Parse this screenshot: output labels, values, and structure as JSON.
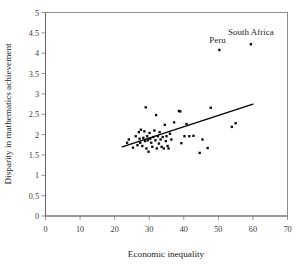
{
  "figure": {
    "background_color": "#ffffff",
    "frame_color": "#8d8d8d",
    "marker_color": "#111111",
    "line_color": "#000000"
  },
  "chart_data": {
    "type": "scatter",
    "title": "",
    "xlabel": "Economic inequality",
    "ylabel": "Disparity in mathematics achievement",
    "xlim": [
      0,
      70
    ],
    "ylim": [
      0,
      5
    ],
    "xticks": [
      0,
      10,
      20,
      30,
      40,
      50,
      60,
      70
    ],
    "yticks": [
      0,
      0.5,
      1,
      1.5,
      2,
      2.5,
      3,
      3.5,
      4,
      4.5,
      5
    ],
    "xtick_labels": [
      "0",
      "10",
      "20",
      "30",
      "40",
      "50",
      "60",
      "70"
    ],
    "ytick_labels": [
      "0",
      "0.5",
      "1",
      "1.5",
      "2",
      "2.5",
      "3",
      "3.5",
      "4",
      "4.5",
      "5"
    ],
    "grid": false,
    "legend": false,
    "marker": "square",
    "marker_size": 2.4,
    "points": [
      [
        23.6,
        1.8
      ],
      [
        24.1,
        1.88
      ],
      [
        25.3,
        1.68
      ],
      [
        26.1,
        1.96
      ],
      [
        26.6,
        1.74
      ],
      [
        27.0,
        2.06
      ],
      [
        27.2,
        1.9
      ],
      [
        27.4,
        1.8
      ],
      [
        27.6,
        2.12
      ],
      [
        28.0,
        1.72
      ],
      [
        28.3,
        1.92
      ],
      [
        28.6,
        2.08
      ],
      [
        28.8,
        1.84
      ],
      [
        29.0,
        2.67
      ],
      [
        29.2,
        1.66
      ],
      [
        29.4,
        1.96
      ],
      [
        29.6,
        1.86
      ],
      [
        29.8,
        1.58
      ],
      [
        30.1,
        2.04
      ],
      [
        30.3,
        1.9
      ],
      [
        30.6,
        1.8
      ],
      [
        30.9,
        1.7
      ],
      [
        31.2,
        1.94
      ],
      [
        31.5,
        2.1
      ],
      [
        31.8,
        1.86
      ],
      [
        32.0,
        2.48
      ],
      [
        32.2,
        1.66
      ],
      [
        32.5,
        1.96
      ],
      [
        32.8,
        1.78
      ],
      [
        33.0,
        2.06
      ],
      [
        33.3,
        1.88
      ],
      [
        33.6,
        1.7
      ],
      [
        33.9,
        1.94
      ],
      [
        34.2,
        1.66
      ],
      [
        34.5,
        2.24
      ],
      [
        34.8,
        1.84
      ],
      [
        35.0,
        1.96
      ],
      [
        35.3,
        1.72
      ],
      [
        35.6,
        1.66
      ],
      [
        36.0,
        2.02
      ],
      [
        36.4,
        1.88
      ],
      [
        37.2,
        2.3
      ],
      [
        38.6,
        2.58
      ],
      [
        39.0,
        2.57
      ],
      [
        39.3,
        1.79
      ],
      [
        40.2,
        1.96
      ],
      [
        40.8,
        2.26
      ],
      [
        41.6,
        1.96
      ],
      [
        42.8,
        1.97
      ],
      [
        44.6,
        1.55
      ],
      [
        45.4,
        1.88
      ],
      [
        46.9,
        1.67
      ],
      [
        47.8,
        2.66
      ],
      [
        53.9,
        2.19
      ],
      [
        55.0,
        2.28
      ]
    ],
    "annotated_points": [
      {
        "label": "Peru",
        "x": 50.3,
        "y": 4.08
      },
      {
        "label": "South Africa",
        "x": 59.4,
        "y": 4.22
      }
    ],
    "trendline": {
      "x0": 22.2,
      "y0": 1.7,
      "x1": 60.0,
      "y1": 2.75
    }
  }
}
